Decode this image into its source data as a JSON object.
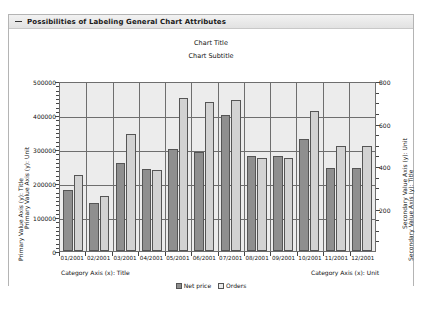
{
  "panel": {
    "title": "Possibilities of Labeling General Chart Attributes",
    "twisty_icon": "collapse-triangle-icon"
  },
  "chart_data": {
    "type": "bar",
    "title": "Chart Title",
    "subtitle": "Chart Subtitle",
    "categories": [
      "01/2001",
      "02/2001",
      "03/2001",
      "04/2001",
      "05/2001",
      "06/2001",
      "07/2001",
      "08/2001",
      "09/2001",
      "10/2001",
      "11/2001",
      "12/2001"
    ],
    "series": [
      {
        "name": "Net price",
        "axis": "primary",
        "color": "#8f8f8f",
        "values": [
          180000,
          140000,
          260000,
          240000,
          300000,
          290000,
          400000,
          280000,
          280000,
          330000,
          245000,
          245000
        ]
      },
      {
        "name": "Orders",
        "axis": "secondary",
        "color": "#d2d2d2",
        "values": [
          360,
          260,
          550,
          380,
          720,
          700,
          710,
          440,
          440,
          660,
          495,
          495
        ]
      }
    ],
    "primary_axis": {
      "title": "Primary Value Axis (y): Title",
      "unit": "Primary Value Axis (y): Unit",
      "ticks": [
        "500000",
        "400000",
        "300000",
        "200000",
        "100000",
        "0"
      ],
      "min": 0,
      "max": 500000
    },
    "secondary_axis": {
      "title": "Secondary Value Axis (y): Title",
      "unit": "Secondary Value Axis (y): Unit",
      "ticks": [
        "800",
        "600",
        "400",
        "200"
      ],
      "min": 0,
      "max": 800
    },
    "category_axis": {
      "title": "Category Axis (x): Title",
      "unit": "Category Axis (x): Unit"
    },
    "legend": {
      "position": "bottom",
      "entries": [
        "Net price",
        "Orders"
      ]
    },
    "grid": true
  }
}
